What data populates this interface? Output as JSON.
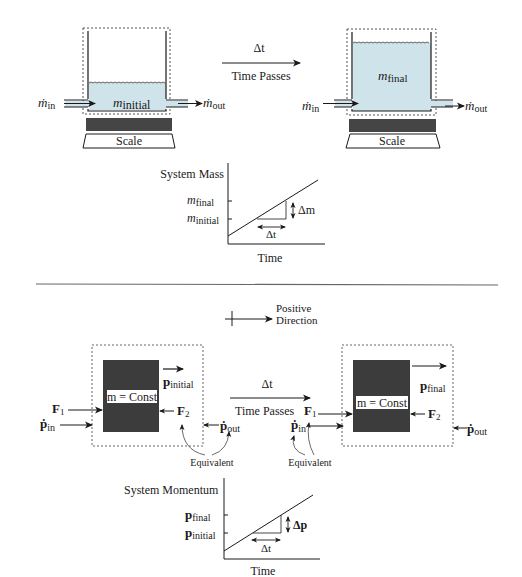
{
  "mass_section": {
    "before": {
      "mass_label": "m",
      "mass_sub": "initial",
      "inflow_label": "ṁ",
      "inflow_sub": "in",
      "outflow_label": "ṁ",
      "outflow_sub": "out",
      "scale_label": "Scale"
    },
    "transition": {
      "delta_label": "Δt",
      "caption": "Time Passes"
    },
    "after": {
      "mass_label": "m",
      "mass_sub": "final",
      "inflow_label": "ṁ",
      "inflow_sub": "in",
      "outflow_label": "ṁ",
      "outflow_sub": "out",
      "scale_label": "Scale"
    },
    "graph": {
      "y_title": "System Mass",
      "x_title": "Time",
      "tick_final": "m",
      "tick_final_sub": "final",
      "tick_initial": "m",
      "tick_initial_sub": "initial",
      "delta_y": "Δm",
      "delta_x": "Δt"
    }
  },
  "direction_key": {
    "line1": "Positive",
    "line2": "Direction"
  },
  "momentum_section": {
    "before": {
      "block_label": "m = Const",
      "momentum_label": "p",
      "momentum_sub": "initial",
      "force1": "F",
      "force1_sub": "1",
      "force2": "F",
      "force2_sub": "2",
      "pin": "ṗ",
      "pin_sub": "in",
      "pout": "ṗ",
      "pout_sub": "out",
      "equivalent": "Equivalent"
    },
    "transition": {
      "delta_label": "Δt",
      "caption": "Time Passes"
    },
    "after": {
      "block_label": "m = Const",
      "momentum_label": "p",
      "momentum_sub": "final",
      "force1": "F",
      "force1_sub": "1",
      "force2": "F",
      "force2_sub": "2",
      "pin": "ṗ",
      "pin_sub": "in",
      "pout": "ṗ",
      "pout_sub": "out",
      "equivalent": "Equivalent"
    },
    "graph": {
      "y_title": "System Momentum",
      "x_title": "Time",
      "tick_final": "p",
      "tick_final_sub": "final",
      "tick_initial": "p",
      "tick_initial_sub": "initial",
      "delta_y": "Δp",
      "delta_x": "Δt"
    }
  },
  "colors": {
    "water": "#cfe3ea",
    "block": "#3c3c3c",
    "plate": "#454545",
    "line": "#1a1a1a",
    "dashed_box": "#555555"
  }
}
